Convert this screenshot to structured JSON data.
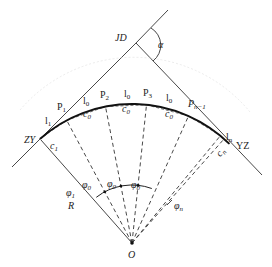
{
  "diagram": {
    "type": "circular curve chord deflection layout",
    "points": {
      "intersection": "JD",
      "curve_start": "ZY",
      "curve_end": "YZ",
      "center": "O",
      "radius": "R"
    },
    "angle_label": "α",
    "arc_point_labels": [
      {
        "base": "P",
        "sub": "1"
      },
      {
        "base": "P",
        "sub": "2"
      },
      {
        "base": "P",
        "sub": "3"
      },
      {
        "base": "P",
        "sub": "n−1"
      }
    ],
    "arc_length_labels": [
      {
        "base": "l",
        "sub": "1"
      },
      {
        "base": "l",
        "sub": "0"
      },
      {
        "base": "l",
        "sub": "0"
      },
      {
        "base": "l",
        "sub": "0"
      },
      {
        "base": "l",
        "sub": "n"
      }
    ],
    "chord_labels": [
      {
        "base": "c",
        "sub": "1"
      },
      {
        "base": "c",
        "sub": "0"
      },
      {
        "base": "c",
        "sub": "0"
      },
      {
        "base": "c",
        "sub": "0"
      },
      {
        "base": "c",
        "sub": "n"
      }
    ],
    "central_angle_labels": [
      {
        "base": "φ",
        "sub": "1"
      },
      {
        "base": "φ",
        "sub": "0"
      },
      {
        "base": "φ",
        "sub": "0"
      },
      {
        "base": "φ",
        "sub": "0"
      },
      {
        "base": "φ",
        "sub": "n"
      }
    ]
  }
}
